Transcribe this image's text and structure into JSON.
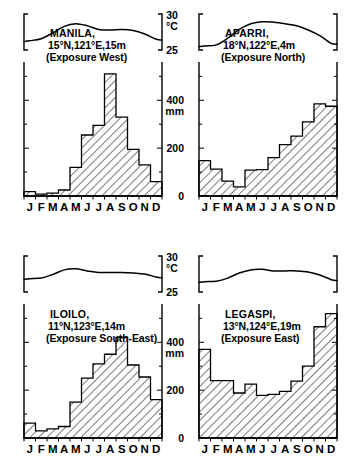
{
  "figure": {
    "title_visible": false,
    "months": [
      "J",
      "F",
      "M",
      "A",
      "M",
      "J",
      "J",
      "A",
      "S",
      "O",
      "N",
      "D"
    ],
    "temp_axis": {
      "unit_label": "°C",
      "top_label": "30",
      "bottom_label": "25",
      "min": 23.5,
      "max": 30.5
    },
    "precip_axis": {
      "unit_label": "mm",
      "ticks": [
        "0",
        "200",
        "400"
      ],
      "min": 0,
      "max": 560
    }
  },
  "chart_data": [
    {
      "type": "bar",
      "panel": "top-left",
      "title": "MANILA,",
      "subtitle": "15°N,121°E,15m",
      "exposure": "(Exposure West)",
      "station": "MANILA",
      "latitude": "15°N",
      "longitude": "121°E",
      "elevation": "15m",
      "categories": [
        "J",
        "F",
        "M",
        "A",
        "M",
        "J",
        "J",
        "A",
        "S",
        "O",
        "N",
        "D"
      ],
      "values": [
        18,
        8,
        12,
        25,
        120,
        255,
        295,
        510,
        330,
        195,
        130,
        60
      ],
      "xlabel": "",
      "ylabel": "mm",
      "ylim": [
        0,
        560
      ],
      "temperature": [
        25.3,
        25.7,
        26.8,
        28.1,
        28.6,
        28.2,
        27.5,
        27.4,
        27.5,
        27.3,
        26.6,
        25.6
      ],
      "tlim": [
        23.5,
        30.5
      ]
    },
    {
      "type": "bar",
      "panel": "top-right",
      "title": "APARRI,",
      "subtitle": "18°N,122°E,4m",
      "exposure": "(Exposure North)",
      "station": "APARRI",
      "latitude": "18°N",
      "longitude": "122°E",
      "elevation": "4m",
      "categories": [
        "J",
        "F",
        "M",
        "A",
        "M",
        "J",
        "J",
        "A",
        "S",
        "O",
        "N",
        "D"
      ],
      "values": [
        148,
        112,
        62,
        38,
        108,
        110,
        160,
        215,
        250,
        310,
        385,
        375
      ],
      "xlabel": "",
      "ylabel": "mm",
      "ylim": [
        0,
        560
      ],
      "temperature": [
        24.3,
        24.5,
        25.8,
        27.5,
        28.6,
        29.0,
        28.9,
        28.6,
        28.2,
        27.4,
        26.3,
        24.8
      ],
      "tlim": [
        23.5,
        30.5
      ]
    },
    {
      "type": "bar",
      "panel": "bottom-left",
      "title": "ILOILO,",
      "subtitle": "11°N,123°E,14m",
      "exposure": "(Exposure  South-East)",
      "station": "ILOILO",
      "latitude": "11°N",
      "longitude": "123°E",
      "elevation": "14m",
      "categories": [
        "J",
        "F",
        "M",
        "A",
        "M",
        "J",
        "J",
        "A",
        "S",
        "O",
        "N",
        "D"
      ],
      "values": [
        62,
        30,
        38,
        48,
        150,
        250,
        310,
        350,
        420,
        305,
        255,
        160
      ],
      "xlabel": "",
      "ylabel": "mm",
      "ylim": [
        0,
        560
      ],
      "temperature": [
        26.1,
        26.2,
        26.9,
        27.8,
        28.0,
        27.6,
        27.3,
        27.3,
        27.3,
        27.2,
        27.0,
        26.4
      ],
      "tlim": [
        23.5,
        30.5
      ]
    },
    {
      "type": "bar",
      "panel": "bottom-right",
      "title": "LEGASPI,",
      "subtitle": "13°N,124°E,19m",
      "exposure": "(Exposure East)",
      "station": "LEGASPI",
      "latitude": "13°N",
      "longitude": "124°E",
      "elevation": "19m",
      "categories": [
        "J",
        "F",
        "M",
        "A",
        "M",
        "J",
        "J",
        "A",
        "S",
        "O",
        "N",
        "D"
      ],
      "values": [
        370,
        240,
        240,
        188,
        225,
        178,
        182,
        195,
        238,
        300,
        465,
        520
      ],
      "xlabel": "",
      "ylabel": "mm",
      "ylim": [
        0,
        560
      ],
      "temperature": [
        25.5,
        25.6,
        26.2,
        27.2,
        27.8,
        27.9,
        27.6,
        27.6,
        27.6,
        27.4,
        26.8,
        25.9
      ],
      "tlim": [
        23.5,
        30.5
      ]
    }
  ]
}
